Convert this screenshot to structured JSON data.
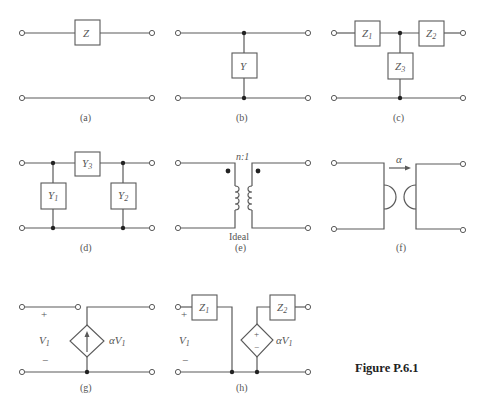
{
  "figure": {
    "caption": "Figure P.6.1"
  },
  "panels": {
    "a": {
      "caption": "(a)",
      "Z": "Z"
    },
    "b": {
      "caption": "(b)",
      "Y": "Y"
    },
    "c": {
      "caption": "(c)",
      "Z1": "Z",
      "Z1_sub": "1",
      "Z2": "Z",
      "Z2_sub": "2",
      "Z3": "Z",
      "Z3_sub": "3"
    },
    "d": {
      "caption": "(d)",
      "Y1": "Y",
      "Y1_sub": "1",
      "Y2": "Y",
      "Y2_sub": "2",
      "Y3": "Y",
      "Y3_sub": "3"
    },
    "e": {
      "caption": "(e)",
      "ratio": "n:1",
      "note": "Ideal"
    },
    "f": {
      "caption": "(f)",
      "alpha": "α"
    },
    "g": {
      "caption": "(g)",
      "plus": "+",
      "minus": "−",
      "V1": "V",
      "V1_sub": "1",
      "source": "αV",
      "source_sub": "1"
    },
    "h": {
      "caption": "(h)",
      "plus": "+",
      "minus": "−",
      "V1": "V",
      "V1_sub": "1",
      "Z1": "Z",
      "Z1_sub": "1",
      "Z2": "Z",
      "Z2_sub": "2",
      "src_plus": "+",
      "src_minus": "−",
      "source": "αV",
      "source_sub": "1"
    }
  }
}
